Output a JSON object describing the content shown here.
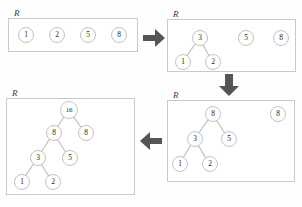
{
  "figure": {
    "node_label": "R",
    "accent_arrow_color": "#555555",
    "node_stroke_color": "#c2c2c2",
    "box_stroke_color": "#c9c9c9",
    "background_color": "#fefefe"
  },
  "panels": [
    {
      "id": "panel-top-left",
      "label": "R",
      "box": {
        "x": 8,
        "y": 18,
        "w": 130,
        "h": 34
      },
      "nodes": [
        {
          "name": "node-1",
          "value": "1",
          "cx": 26,
          "cy": 35,
          "r": 8
        },
        {
          "name": "node-2",
          "value": "2",
          "cx": 57,
          "cy": 35,
          "r": 8
        },
        {
          "name": "node-5",
          "value": "5",
          "cx": 88,
          "cy": 35,
          "r": 8
        },
        {
          "name": "node-8",
          "value": "8",
          "cx": 119,
          "cy": 35,
          "r": 8
        }
      ],
      "edges": []
    },
    {
      "id": "panel-top-right",
      "label": "R",
      "box": {
        "x": 167,
        "y": 19,
        "w": 129,
        "h": 53
      },
      "nodes": [
        {
          "name": "node-3",
          "value": "3",
          "cx": 200,
          "cy": 38,
          "r": 8
        },
        {
          "name": "node-1",
          "value": "1",
          "cx": 183,
          "cy": 62,
          "r": 8
        },
        {
          "name": "node-2",
          "value": "2",
          "cx": 213,
          "cy": 62,
          "r": 8
        },
        {
          "name": "node-5",
          "value": "5",
          "cx": 246,
          "cy": 38,
          "r": 8
        },
        {
          "name": "node-8",
          "value": "8",
          "cx": 281,
          "cy": 38,
          "r": 8
        }
      ],
      "edges": [
        {
          "x1": 200,
          "y1": 38,
          "x2": 183,
          "y2": 62
        },
        {
          "x1": 200,
          "y1": 38,
          "x2": 213,
          "y2": 62
        }
      ]
    },
    {
      "id": "panel-bottom-right",
      "label": "R",
      "box": {
        "x": 167,
        "y": 100,
        "w": 128,
        "h": 82
      },
      "nodes": [
        {
          "name": "node-8-root",
          "value": "8",
          "cx": 213,
          "cy": 114,
          "r": 8
        },
        {
          "name": "node-3",
          "value": "3",
          "cx": 195,
          "cy": 139,
          "r": 8
        },
        {
          "name": "node-5",
          "value": "5",
          "cx": 229,
          "cy": 139,
          "r": 8
        },
        {
          "name": "node-1",
          "value": "1",
          "cx": 180,
          "cy": 164,
          "r": 8
        },
        {
          "name": "node-2",
          "value": "2",
          "cx": 210,
          "cy": 164,
          "r": 8
        },
        {
          "name": "node-8-loose",
          "value": "8",
          "cx": 278,
          "cy": 114,
          "r": 8
        }
      ],
      "edges": [
        {
          "x1": 213,
          "y1": 114,
          "x2": 195,
          "y2": 139
        },
        {
          "x1": 213,
          "y1": 114,
          "x2": 229,
          "y2": 139
        },
        {
          "x1": 195,
          "y1": 139,
          "x2": 180,
          "y2": 164
        },
        {
          "x1": 195,
          "y1": 139,
          "x2": 210,
          "y2": 164
        }
      ]
    },
    {
      "id": "panel-bottom-left",
      "label": "R",
      "box": {
        "x": 6,
        "y": 98,
        "w": 129,
        "h": 97
      },
      "nodes": [
        {
          "name": "node-16",
          "value": "16",
          "cx": 69,
          "cy": 110,
          "r": 9
        },
        {
          "name": "node-8-left",
          "value": "8",
          "cx": 54,
          "cy": 133,
          "r": 8
        },
        {
          "name": "node-8-right",
          "value": "8",
          "cx": 86,
          "cy": 133,
          "r": 8
        },
        {
          "name": "node-3",
          "value": "3",
          "cx": 38,
          "cy": 158,
          "r": 8
        },
        {
          "name": "node-5",
          "value": "5",
          "cx": 70,
          "cy": 158,
          "r": 8
        },
        {
          "name": "node-1",
          "value": "1",
          "cx": 22,
          "cy": 182,
          "r": 8
        },
        {
          "name": "node-2",
          "value": "2",
          "cx": 53,
          "cy": 182,
          "r": 8
        }
      ],
      "edges": [
        {
          "x1": 69,
          "y1": 110,
          "x2": 54,
          "y2": 133
        },
        {
          "x1": 69,
          "y1": 110,
          "x2": 86,
          "y2": 133
        },
        {
          "x1": 54,
          "y1": 133,
          "x2": 38,
          "y2": 158
        },
        {
          "x1": 54,
          "y1": 133,
          "x2": 70,
          "y2": 158
        },
        {
          "x1": 38,
          "y1": 158,
          "x2": 22,
          "y2": 182
        },
        {
          "x1": 38,
          "y1": 158,
          "x2": 53,
          "y2": 182
        }
      ]
    }
  ],
  "arrows": [
    {
      "name": "arrow-right-step1",
      "direction": "right",
      "x": 143,
      "y": 28,
      "w": 22,
      "h": 20
    },
    {
      "name": "arrow-down-step2",
      "direction": "down",
      "x": 219,
      "y": 74,
      "w": 20,
      "h": 22
    },
    {
      "name": "arrow-left-step3",
      "direction": "left",
      "x": 138,
      "y": 131,
      "w": 24,
      "h": 20
    }
  ],
  "chart_data": {
    "type": "diagram",
    "steps": [
      {
        "step": 1,
        "panel": "panel-top-left",
        "description": "Four singleton nodes in root list R",
        "roots": [
          "1",
          "2",
          "5",
          "8"
        ]
      },
      {
        "step": 2,
        "panel": "panel-top-right",
        "description": "Nodes 1 and 2 linked under new root 3",
        "roots": [
          "3",
          "5",
          "8"
        ]
      },
      {
        "step": 3,
        "panel": "panel-bottom-right",
        "description": "Subtree 3 and node 5 linked under new root 8",
        "roots": [
          "8",
          "8"
        ]
      },
      {
        "step": 4,
        "panel": "panel-bottom-left",
        "description": "Both 8 roots linked under new root 16",
        "roots": [
          "16"
        ]
      }
    ]
  }
}
